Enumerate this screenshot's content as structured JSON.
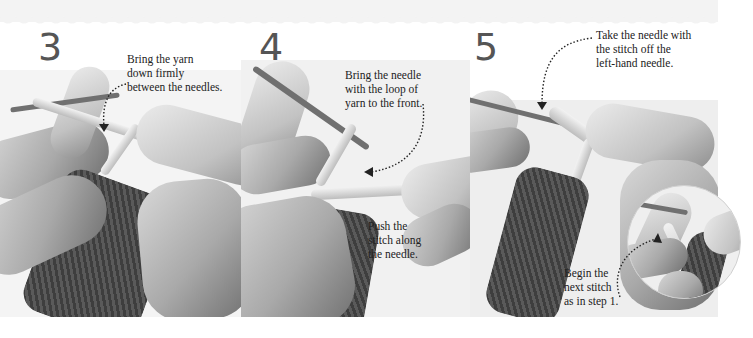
{
  "steps": [
    {
      "number": "3",
      "captions": [
        {
          "lines": [
            "Bring the yarn",
            "down firmly",
            "between the needles."
          ]
        }
      ]
    },
    {
      "number": "4",
      "captions": [
        {
          "lines": [
            "Bring the needle",
            "with the loop of",
            "yarn to the front."
          ]
        },
        {
          "lines": [
            "Push the",
            "stitch along",
            "the needle."
          ]
        }
      ]
    },
    {
      "number": "5",
      "captions": [
        {
          "lines": [
            "Take the needle with",
            "the stitch off the",
            "left-hand needle."
          ]
        },
        {
          "lines": [
            "Begin the",
            "next stitch",
            "as in step 1."
          ]
        }
      ]
    }
  ],
  "colors": {
    "step_number": "#555555",
    "caption_text": "#222222",
    "background": "#ffffff",
    "yarn": "#5a5a5a"
  },
  "icons": [
    "dotted-arrow-icon"
  ]
}
